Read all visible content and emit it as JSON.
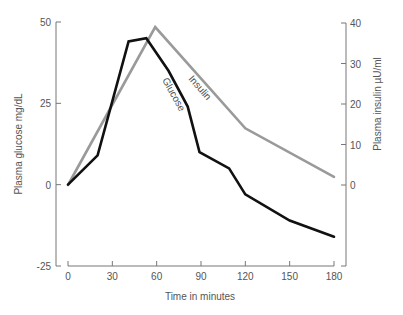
{
  "chart_data": {
    "type": "line",
    "title": "",
    "xlabel": "Time in minutes",
    "ylabel": "Plasma glucose mg/dL",
    "ylabel_right": "Plasma insulin µU/ml",
    "x_ticks": [
      0,
      30,
      60,
      90,
      120,
      150,
      180
    ],
    "y_ticks_left": [
      50,
      25,
      0,
      -25
    ],
    "y_ticks_right": [
      40,
      30,
      20,
      10,
      0
    ],
    "xlim": [
      0,
      180
    ],
    "ylim": [
      -25,
      50
    ],
    "ylim_right": [
      0,
      40
    ],
    "grid": false,
    "legend": "inline labels",
    "series": [
      {
        "name": "Glucose",
        "axis": "left",
        "color": "#111111",
        "x": [
          0,
          20,
          41,
          53,
          68,
          81,
          89,
          109,
          120,
          150,
          180
        ],
        "values": [
          0,
          9,
          44,
          45,
          35,
          24,
          10,
          5,
          -3,
          -11,
          -16
        ]
      },
      {
        "name": "Insulin",
        "axis": "right",
        "color": "#9a9a9a",
        "x": [
          0,
          59,
          120,
          180
        ],
        "values": [
          0,
          39,
          14,
          2
        ]
      }
    ],
    "annotations": [
      "Glucose",
      "Insulin"
    ]
  },
  "labels": {
    "xlabel": "Time in minutes",
    "ylabel_left": "Plasma glucose mg/dL",
    "ylabel_right": "Plasma insulin µU/ml",
    "glucose": "Glucose",
    "insulin": "Insulin"
  }
}
